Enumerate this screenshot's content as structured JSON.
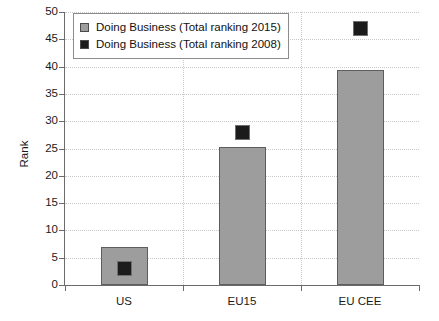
{
  "chart_data": {
    "type": "bar",
    "title": "",
    "xlabel": "",
    "ylabel": "Rank",
    "categories": [
      "US",
      "EU15",
      "EU CEE"
    ],
    "ylim": [
      0,
      50
    ],
    "yticks": [
      0,
      5,
      10,
      15,
      20,
      25,
      30,
      35,
      40,
      45,
      50
    ],
    "grid": true,
    "legend_position": "upper left (inside plot)",
    "series": [
      {
        "name": "Doing Business (Total ranking 2015)",
        "render": "bar",
        "color": "#9d9d9d",
        "values": [
          7,
          25.3,
          39.3
        ]
      },
      {
        "name": "Doing Business (Total ranking 2008)",
        "render": "marker",
        "color": "#1c1c1c",
        "values": [
          3,
          28,
          47
        ]
      }
    ]
  },
  "axis": {
    "y_title": "Rank",
    "y_tick_labels": [
      "0",
      "5",
      "10",
      "15",
      "20",
      "25",
      "30",
      "35",
      "40",
      "45",
      "50"
    ],
    "x_tick_labels": [
      "US",
      "EU15",
      "EU CEE"
    ]
  },
  "legend": {
    "entries": [
      {
        "label": "Doing Business (Total ranking 2015)",
        "swatch": "gray-square-swatch"
      },
      {
        "label": "Doing Business (Total ranking 2008)",
        "swatch": "black-square-swatch"
      }
    ]
  }
}
